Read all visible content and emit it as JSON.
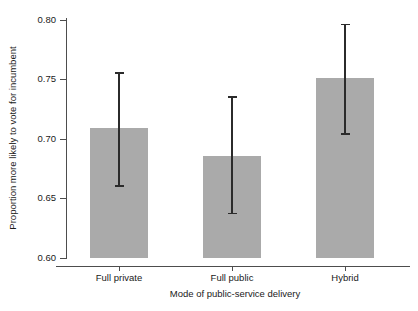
{
  "chart_data": {
    "type": "bar",
    "title": "",
    "xlabel": "Mode of public-service delivery",
    "ylabel": "Proportion more likely to vote for incumbent",
    "categories": [
      "Full private",
      "Full public",
      "Hybrid"
    ],
    "values": [
      0.709,
      0.686,
      0.751
    ],
    "error_low": [
      0.661,
      0.638,
      0.705
    ],
    "error_high": [
      0.756,
      0.736,
      0.797
    ],
    "ylim": [
      0.6,
      0.8
    ],
    "yticks": [
      0.6,
      0.65,
      0.7,
      0.75,
      0.8
    ],
    "ytick_labels": [
      "0.60",
      "0.65",
      "0.70",
      "0.75",
      "0.80"
    ],
    "grid": false,
    "legend": "none",
    "bar_color": "#aaaaaa",
    "error_bar_color": "#2b2b2b",
    "axis_color": "#4d4d4d",
    "background": "#ffffff"
  },
  "axes": {
    "y_title": "Proportion more likely to vote for incumbent",
    "x_title": "Mode of public-service delivery"
  },
  "ticks": {
    "y": [
      {
        "label": "0.80",
        "value": 0.8
      },
      {
        "label": "0.75",
        "value": 0.75
      },
      {
        "label": "0.70",
        "value": 0.7
      },
      {
        "label": "0.65",
        "value": 0.65
      },
      {
        "label": "0.60",
        "value": 0.6
      }
    ],
    "x": [
      {
        "label": "Full private"
      },
      {
        "label": "Full public"
      },
      {
        "label": "Hybrid"
      }
    ]
  }
}
